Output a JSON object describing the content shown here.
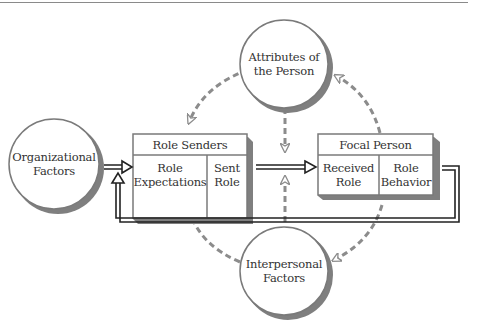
{
  "diagram": {
    "type": "role-episode-model",
    "colors": {
      "box_shadow": "#7f7f7f",
      "dashed": "#8c8c8c",
      "line": "#222222",
      "border": "#7a7a7a"
    },
    "circles": {
      "organizational": {
        "line1": "Organizational",
        "line2": "Factors"
      },
      "attributes": {
        "line1": "Attributes of",
        "line2": "the Person"
      },
      "interpersonal": {
        "line1": "Interpersonal",
        "line2": "Factors"
      }
    },
    "role_senders": {
      "title": "Role Senders",
      "cells": [
        {
          "line1": "Role",
          "line2": "Expectations"
        },
        {
          "line1": "Sent",
          "line2": "Role"
        }
      ]
    },
    "focal_person": {
      "title": "Focal Person",
      "cells": [
        {
          "line1": "Received",
          "line2": "Role"
        },
        {
          "line1": "Role",
          "line2": "Behavior"
        }
      ]
    },
    "connections": [
      {
        "from": "Organizational Factors",
        "to": "Role Senders",
        "style": "double-solid"
      },
      {
        "from": "Role Senders",
        "to": "Focal Person",
        "style": "double-solid"
      },
      {
        "from": "Focal Person",
        "to": "Role Senders",
        "style": "double-solid-feedback"
      },
      {
        "from": "Attributes of the Person",
        "to": "Role Senders",
        "style": "dashed"
      },
      {
        "from": "Attributes of the Person",
        "to": "Role Senders-Focal Person link",
        "style": "dashed"
      },
      {
        "from": "Focal Person",
        "to": "Attributes of the Person",
        "style": "dashed"
      },
      {
        "from": "Interpersonal Factors",
        "to": "Role Senders",
        "style": "dashed"
      },
      {
        "from": "Interpersonal Factors",
        "to": "Role Senders-Focal Person link",
        "style": "dashed"
      },
      {
        "from": "Focal Person",
        "to": "Interpersonal Factors",
        "style": "dashed"
      }
    ]
  }
}
